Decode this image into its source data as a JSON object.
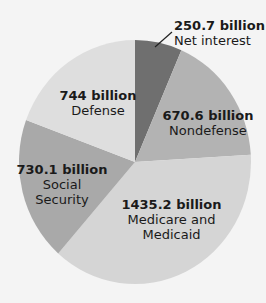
{
  "chart_data": {
    "type": "pie",
    "title": "",
    "unit": "billion",
    "categories": [
      "Net interest",
      "Nondefense",
      "Medicare and Medicaid",
      "Social Security",
      "Defense"
    ],
    "values": [
      250.7,
      670.6,
      1435.2,
      730.1,
      744
    ],
    "value_labels": [
      "250.7 billion",
      "670.6 billion",
      "1435.2 billion",
      "730.1 billion",
      "744 billion"
    ],
    "colors": [
      "#6f6f6f",
      "#b3b3b3",
      "#d5d5d5",
      "#a9a9a9",
      "#dedede"
    ],
    "start_angle": "top (12 o'clock), clockwise",
    "legend": "none (direct labels)"
  },
  "labels": {
    "net_interest": {
      "value": "250.7 billion",
      "name": "Net interest"
    },
    "nondefense": {
      "value": "670.6 billion",
      "name": "Nondefense"
    },
    "medicare": {
      "value": "1435.2 billion",
      "name1": "Medicare and",
      "name2": "Medicaid"
    },
    "social_security": {
      "value": "730.1 billion",
      "name1": "Social",
      "name2": "Security"
    },
    "defense": {
      "value": "744 billion",
      "name": "Defense"
    }
  }
}
